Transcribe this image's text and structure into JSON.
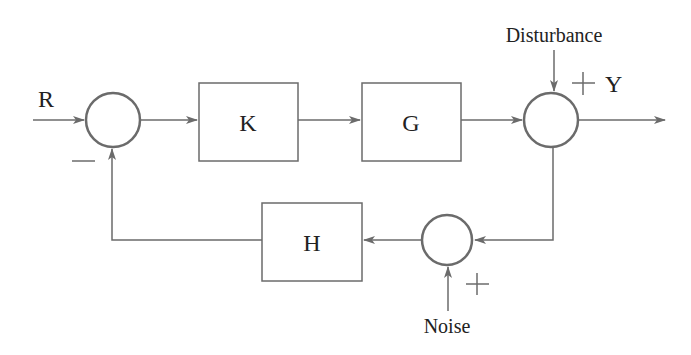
{
  "diagram": {
    "type": "feedback control block diagram",
    "input_label": "R",
    "output_label": "Y",
    "blocks": [
      {
        "id": "K",
        "label": "K"
      },
      {
        "id": "G",
        "label": "G"
      },
      {
        "id": "H",
        "label": "H"
      }
    ],
    "external_inputs": {
      "disturbance": "Disturbance",
      "noise": "Noise"
    },
    "signs": {
      "feedback_sign": "−",
      "disturbance_sign": "+",
      "noise_sign": "+"
    },
    "colors": {
      "line": "#6b6b6b",
      "text": "#222222"
    }
  }
}
